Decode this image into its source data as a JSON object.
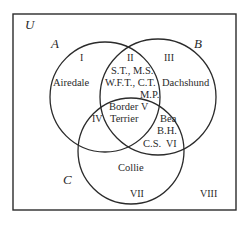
{
  "universe_label": "U",
  "sets": [
    {
      "label": "A",
      "name": "set-a"
    },
    {
      "label": "B",
      "name": "set-b"
    },
    {
      "label": "C",
      "name": "set-c"
    }
  ],
  "regions": {
    "I": {
      "numeral": "I",
      "content": "Airedale"
    },
    "II": {
      "numeral": "II",
      "content": [
        "S.T., M.S.",
        "W.F.T., C.T.",
        "M.P."
      ]
    },
    "III": {
      "numeral": "III",
      "content": "Dachshund"
    },
    "IV": {
      "numeral": "IV",
      "content": ""
    },
    "V": {
      "numeral": "V",
      "content": [
        "Border",
        "Terrier"
      ]
    },
    "VI": {
      "numeral": "VI",
      "content": [
        "Bea",
        "B.H.",
        "C.S."
      ]
    },
    "VII": {
      "numeral": "VII",
      "content": "Collie"
    },
    "VIII": {
      "numeral": "VIII",
      "content": ""
    }
  },
  "colors": {
    "stroke": "#2b2b2b",
    "background": "#ffffff"
  }
}
